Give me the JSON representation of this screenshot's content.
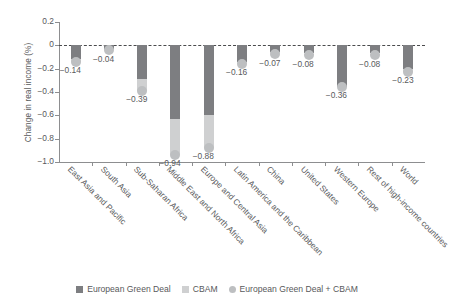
{
  "chart_data": {
    "type": "bar",
    "title": "",
    "xlabel": "",
    "ylabel": "Change in real income (%)",
    "ylim": [
      -1.0,
      0.2
    ],
    "yticks": [
      0.2,
      0,
      -0.2,
      -0.4,
      -0.6,
      -0.8,
      -1.0
    ],
    "ytick_labels": [
      "0.2",
      "0",
      "-0.2",
      "-0.4",
      "-0.6",
      "-0.8",
      "-1.0"
    ],
    "grid": false,
    "zero_reference_line": true,
    "legend_position": "bottom",
    "stacked": true,
    "categories": [
      "East Asia and Pacific",
      "South Asia",
      "Sub-Saharan Africa",
      "Middle East and North Africa",
      "Europe and Central Asia",
      "Latin America and the Caribbean",
      "China",
      "United States",
      "Western Europe",
      "Rest of high-income countries",
      "World"
    ],
    "series": [
      {
        "name": "European Green Deal",
        "color": "#7d7e81",
        "values": [
          -0.12,
          -0.03,
          -0.29,
          -0.63,
          -0.6,
          -0.14,
          -0.06,
          -0.07,
          -0.36,
          -0.07,
          -0.2
        ]
      },
      {
        "name": "CBAM",
        "color": "#cfd0d1",
        "values": [
          -0.02,
          -0.01,
          -0.1,
          -0.31,
          -0.28,
          -0.02,
          -0.01,
          -0.01,
          0.08,
          -0.01,
          -0.03
        ]
      }
    ],
    "totals_marker": {
      "name": "European Green Deal + CBAM",
      "color": "#bdbfc1",
      "values": [
        -0.14,
        -0.04,
        -0.39,
        -0.94,
        -0.88,
        -0.16,
        -0.07,
        -0.08,
        -0.36,
        -0.08,
        -0.23
      ]
    },
    "data_labels": [
      "-0.14",
      "-0.04",
      "-0.39",
      "-0.94",
      "-0.88",
      "-0.16",
      "-0.07",
      "-0.08",
      "-0.36",
      "-0.08",
      "-0.23"
    ]
  },
  "legend": {
    "items": [
      {
        "label": "European Green Deal",
        "marker": "square",
        "color": "#7d7e81"
      },
      {
        "label": "CBAM",
        "marker": "square",
        "color": "#cfd0d1"
      },
      {
        "label": "European Green Deal + CBAM",
        "marker": "circle",
        "color": "#bdbfc1"
      }
    ]
  }
}
